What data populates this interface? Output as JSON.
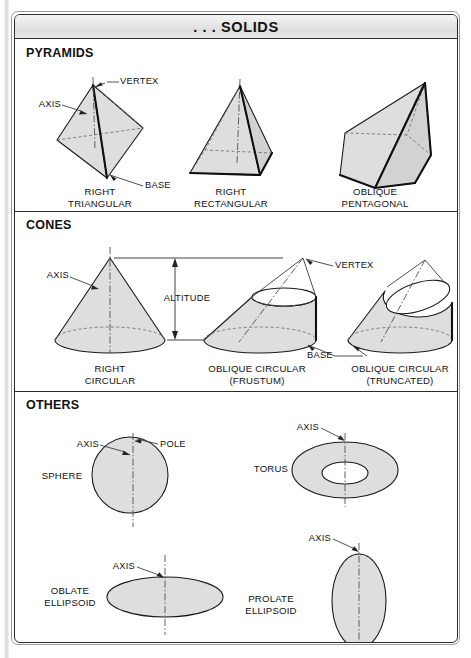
{
  "header": {
    "title": ". . . SOLIDS"
  },
  "sections": [
    {
      "id": "pyramids",
      "title": "PYRAMIDS",
      "figures": [
        {
          "id": "right-triangular-pyramid",
          "caption": "RIGHT\nTRIANGULAR"
        },
        {
          "id": "right-rectangular-pyramid",
          "caption": "RIGHT\nRECTANGULAR"
        },
        {
          "id": "oblique-pentagonal-pyramid",
          "caption": "OBLIQUE\nPENTAGONAL"
        }
      ],
      "annotations": [
        {
          "id": "pyramid-vertex",
          "text": "VERTEX"
        },
        {
          "id": "pyramid-axis",
          "text": "AXIS"
        },
        {
          "id": "pyramid-base",
          "text": "BASE"
        }
      ]
    },
    {
      "id": "cones",
      "title": "CONES",
      "figures": [
        {
          "id": "right-circular-cone",
          "caption": "RIGHT\nCIRCULAR"
        },
        {
          "id": "oblique-circular-frustum",
          "caption": "OBLIQUE CIRCULAR\n(FRUSTUM)"
        },
        {
          "id": "oblique-circular-truncated",
          "caption": "OBLIQUE CIRCULAR\n(TRUNCATED)"
        }
      ],
      "annotations": [
        {
          "id": "cone-axis",
          "text": "AXIS"
        },
        {
          "id": "cone-altitude",
          "text": "ALTITUDE"
        },
        {
          "id": "cone-vertex",
          "text": "VERTEX"
        },
        {
          "id": "cone-base",
          "text": "BASE"
        }
      ]
    },
    {
      "id": "others",
      "title": "OTHERS",
      "figures": [
        {
          "id": "sphere",
          "caption": "SPHERE"
        },
        {
          "id": "torus",
          "caption": "TORUS"
        },
        {
          "id": "oblate-ellipsoid",
          "caption": "OBLATE\nELLIPSOID"
        },
        {
          "id": "prolate-ellipsoid",
          "caption": "PROLATE\nELLIPSOID"
        }
      ],
      "annotations": [
        {
          "id": "sphere-axis",
          "text": "AXIS"
        },
        {
          "id": "sphere-pole",
          "text": "POLE"
        },
        {
          "id": "torus-axis",
          "text": "AXIS"
        },
        {
          "id": "oblate-axis",
          "text": "AXIS"
        },
        {
          "id": "prolate-axis",
          "text": "AXIS"
        }
      ]
    }
  ],
  "colors": {
    "solid_fill": "#dedede",
    "outline": "#1a1a1a",
    "frame": "#2b2b2b",
    "title_bar": "#e4e4e4",
    "page_background": "#ffffff"
  }
}
